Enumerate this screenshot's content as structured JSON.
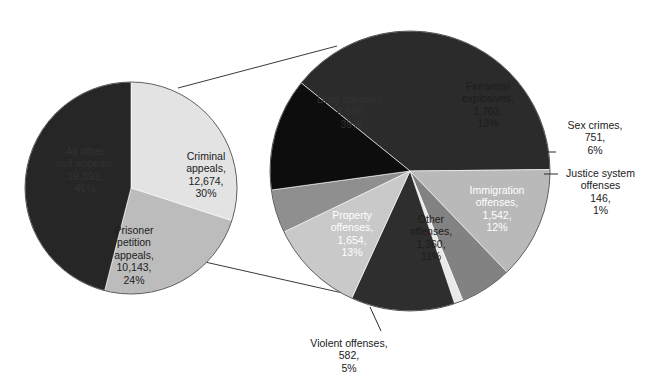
{
  "chart_data": {
    "type": "pie",
    "title": "",
    "subtitle": "",
    "xlabel": "",
    "ylabel": "",
    "legend_position": "none",
    "grid": false,
    "charts": [
      {
        "name": "appeals-overview",
        "role": "primary",
        "total": 42709,
        "categories": [
          "Criminal appeals",
          "Prisoner petition appeals",
          "All other civil appeals"
        ],
        "values": [
          12674,
          10143,
          19892
        ],
        "percents": [
          30,
          24,
          46
        ],
        "colors": [
          "#e3e3e3",
          "#bcbcbc",
          "#262626"
        ],
        "slices": [
          {
            "label": "Criminal appeals",
            "value": "12,674",
            "percent": "30%",
            "text": "Criminal\nappeals,\n12,674,\n30%",
            "color": "#e3e3e3",
            "text_tone": "dark"
          },
          {
            "label": "Prisoner petition appeals",
            "value": "10,143",
            "percent": "24%",
            "text": "Prisoner\npetition\nappeals,\n10,143,\n24%",
            "color": "#bcbcbc",
            "text_tone": "dark"
          },
          {
            "label": "All other civil appeals",
            "value": "19,892",
            "percent": "46%",
            "text": "All other\ncivil appeals,\n19,892,\n46%",
            "color": "#262626",
            "text_tone": "on-black"
          }
        ]
      },
      {
        "name": "criminal-appeals-breakdown",
        "role": "exploded-detail",
        "parent_slice": "Criminal appeals",
        "total": 12674,
        "categories": [
          "Drug offenses",
          "Firearms/explosives",
          "Sex crimes",
          "Justice system offenses",
          "Immigration offenses",
          "Other offenses",
          "Violent offenses",
          "Property offenses"
        ],
        "values": [
          4936,
          1703,
          751,
          146,
          1542,
          1360,
          582,
          1654
        ],
        "percents": [
          39,
          13,
          6,
          1,
          12,
          11,
          5,
          13
        ],
        "colors": [
          "#2b2b2b",
          "#b9b9b9",
          "#828282",
          "#e9e9e9",
          "#2e2e2e",
          "#c9c9c9",
          "#8f8f8f",
          "#0d0d0d"
        ],
        "slices": [
          {
            "label": "Drug offenses",
            "value": "4,936",
            "percent": "39%",
            "text": "Drug offenses,\n4,936,\n39%",
            "color": "#2b2b2b",
            "text_tone": "on-black",
            "placement": "inside"
          },
          {
            "label": "Firearms/explosives",
            "value": "1,703",
            "percent": "13%",
            "text": "Firearms/\nexplosives,\n1,703,\n13%",
            "color": "#b9b9b9",
            "text_tone": "dark",
            "placement": "inside"
          },
          {
            "label": "Sex crimes",
            "value": "751",
            "percent": "6%",
            "text": "Sex crimes,\n751,\n6%",
            "color": "#828282",
            "text_tone": "outside",
            "placement": "outside-leader"
          },
          {
            "label": "Justice system offenses",
            "value": "146",
            "percent": "1%",
            "text": "Justice system\noffenses\n146,\n1%",
            "color": "#e9e9e9",
            "text_tone": "outside",
            "placement": "outside-leader"
          },
          {
            "label": "Immigration offenses",
            "value": "1,542",
            "percent": "12%",
            "text": "Immigration\noffenses,\n1,542,\n12%",
            "color": "#2e2e2e",
            "text_tone": "light",
            "placement": "inside"
          },
          {
            "label": "Other offenses",
            "value": "1,360",
            "percent": "11%",
            "text": "Other\noffenses,\n1,360,\n11%",
            "color": "#c9c9c9",
            "text_tone": "dark",
            "placement": "inside"
          },
          {
            "label": "Violent offenses",
            "value": "582",
            "percent": "5%",
            "text": "Violent offenses,\n582,\n5%",
            "color": "#8f8f8f",
            "text_tone": "outside",
            "placement": "outside-leader"
          },
          {
            "label": "Property offenses",
            "value": "1,654",
            "percent": "13%",
            "text": "Property\noffenses,\n1,654,\n13%",
            "color": "#0d0d0d",
            "text_tone": "light",
            "placement": "inside"
          }
        ]
      }
    ],
    "connectors": [
      {
        "name": "callout-top",
        "from": [
          178,
          88
        ],
        "to": [
          337,
          46
        ]
      },
      {
        "name": "callout-bottom",
        "from": [
          205,
          262
        ],
        "to": [
          347,
          294
        ]
      }
    ]
  },
  "labels": {
    "small": {
      "criminal": "Criminal\nappeals,\n12,674,\n30%",
      "prisoner": "Prisoner\npetition\nappeals,\n10,143,\n24%",
      "civil": "All other\ncivil appeals,\n19,892,\n46%"
    },
    "large": {
      "drug": "Drug offenses,\n4,936,\n39%",
      "firearms": "Firearms/\nexplosives,\n1,703,\n13%",
      "sex": "Sex crimes,\n751,\n6%",
      "justice": "Justice system\noffenses\n146,\n1%",
      "immigration": "Immigration\noffenses,\n1,542,\n12%",
      "other": "Other\noffenses,\n1,360,\n11%",
      "violent": "Violent offenses,\n582,\n5%",
      "property": "Property\noffenses,\n1,654,\n13%"
    }
  }
}
